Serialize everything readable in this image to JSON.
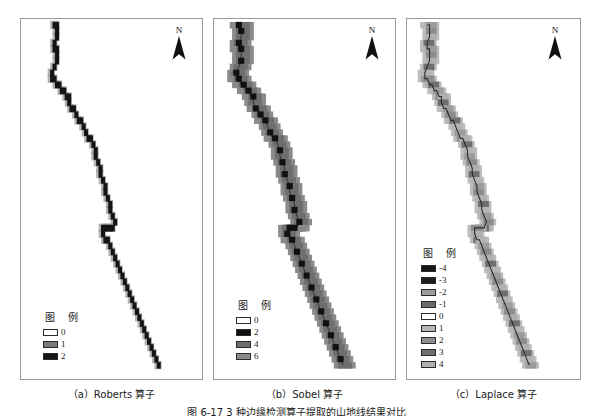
{
  "figure": {
    "main_caption": "图 6-17  3 种边缘检测算子提取的山地线结果对比",
    "north_label": "N"
  },
  "panels": [
    {
      "id": "a",
      "caption": "（a）Roberts 算子",
      "legend": {
        "title": "图  例",
        "items": [
          {
            "label": "0",
            "color": "#ffffff"
          },
          {
            "label": "1",
            "color": "#7a7a7a"
          },
          {
            "label": "2",
            "color": "#141414"
          }
        ]
      }
    },
    {
      "id": "b",
      "caption": "（b）Sobel 算子",
      "legend": {
        "title": "图  例",
        "items": [
          {
            "label": "0",
            "color": "#ffffff"
          },
          {
            "label": "2",
            "color": "#111111"
          },
          {
            "label": "4",
            "color": "#6e6e6e"
          },
          {
            "label": "6",
            "color": "#8a8a8a"
          }
        ]
      }
    },
    {
      "id": "c",
      "caption": "（c）Laplace 算子",
      "legend": {
        "title": "图  例",
        "items": [
          {
            "label": "-4",
            "color": "#151515"
          },
          {
            "label": "-3",
            "color": "#1d1d1d"
          },
          {
            "label": "-2",
            "color": "#9c9c9c"
          },
          {
            "label": "-1",
            "color": "#6b6b6b"
          },
          {
            "label": "0",
            "color": "#ffffff"
          },
          {
            "label": "1",
            "color": "#b5b5b5"
          },
          {
            "label": "2",
            "color": "#8d8d8d"
          },
          {
            "label": "3",
            "color": "#6f6f6f"
          },
          {
            "label": "4",
            "color": "#b0b0b0"
          }
        ]
      }
    }
  ],
  "chart_data": {
    "type": "map",
    "title": "3 种边缘检测算子提取的山地线结果对比",
    "grid": true,
    "cell_size_px": 6,
    "ridge_cells": [
      [
        13,
        2
      ],
      [
        14,
        2
      ],
      [
        14,
        3
      ],
      [
        14,
        4
      ],
      [
        13,
        5
      ],
      [
        13,
        6
      ],
      [
        14,
        6
      ],
      [
        14,
        7
      ],
      [
        14,
        8
      ],
      [
        13,
        9
      ],
      [
        12,
        10
      ],
      [
        12,
        11
      ],
      [
        13,
        11
      ],
      [
        14,
        12
      ],
      [
        15,
        12
      ],
      [
        16,
        13
      ],
      [
        17,
        13
      ],
      [
        18,
        14
      ],
      [
        19,
        14
      ],
      [
        19,
        15
      ],
      [
        20,
        16
      ],
      [
        21,
        16
      ],
      [
        22,
        17
      ],
      [
        23,
        18
      ],
      [
        24,
        18
      ],
      [
        25,
        19
      ],
      [
        26,
        20
      ],
      [
        27,
        21
      ],
      [
        28,
        21
      ],
      [
        29,
        22
      ],
      [
        30,
        23
      ],
      [
        30,
        24
      ],
      [
        31,
        25
      ],
      [
        32,
        26
      ],
      [
        32,
        27
      ],
      [
        33,
        28
      ],
      [
        34,
        29
      ],
      [
        34,
        30
      ],
      [
        35,
        31
      ],
      [
        36,
        32
      ],
      [
        36,
        33
      ],
      [
        37,
        34
      ],
      [
        38,
        35
      ],
      [
        37,
        36
      ],
      [
        36,
        36
      ],
      [
        35,
        36
      ],
      [
        34,
        36
      ],
      [
        33,
        36
      ],
      [
        33,
        37
      ],
      [
        34,
        38
      ],
      [
        35,
        38
      ],
      [
        36,
        39
      ],
      [
        37,
        40
      ],
      [
        38,
        41
      ],
      [
        39,
        42
      ],
      [
        40,
        43
      ],
      [
        41,
        44
      ],
      [
        42,
        45
      ],
      [
        43,
        46
      ],
      [
        44,
        47
      ],
      [
        45,
        48
      ],
      [
        46,
        49
      ],
      [
        47,
        50
      ],
      [
        48,
        51
      ],
      [
        49,
        52
      ],
      [
        50,
        53
      ],
      [
        51,
        54
      ],
      [
        52,
        55
      ],
      [
        53,
        56
      ],
      [
        54,
        57
      ],
      [
        55,
        58
      ],
      [
        56,
        59
      ]
    ],
    "series": [
      {
        "name": "Roberts",
        "style": "thin dark stair-step line, classes 0/1/2"
      },
      {
        "name": "Sobel",
        "style": "wide grey buffer with dark square cells along centre, classes 0/2/4/6"
      },
      {
        "name": "Laplace",
        "style": "medium grey blocky band, classes -4..4"
      }
    ]
  }
}
